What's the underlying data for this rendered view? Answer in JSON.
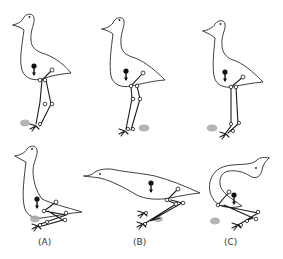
{
  "figure": {
    "panel_labels": [
      "(A)",
      "(B)",
      "(C)"
    ],
    "colors": {
      "outline": "#2a2a2a",
      "shadow": "#a8a8a8",
      "background": "#ffffff"
    }
  }
}
